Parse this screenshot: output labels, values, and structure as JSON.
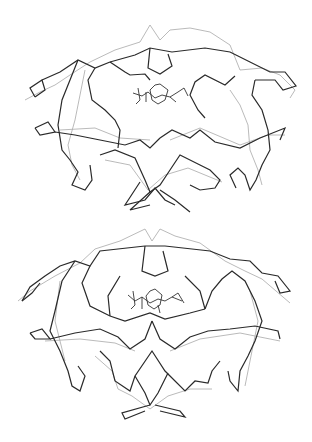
{
  "figure": {
    "panels": [
      {
        "id": "top",
        "description": "Superposition of two protein C-alpha backbone traces (dimer) with bound ligand in active site",
        "colors": {
          "dark": "#2a2a2a",
          "light": "#a8a8a8",
          "ligand": "#333333"
        },
        "dark_paths": [
          "35,97 30,88 42,80 45,90 35,97",
          "42,80 60,72 78,60 95,68 110,62",
          "110,62 135,55 150,48 172,52 205,48 230,52 250,62 270,72 285,72 296,86 283,90 275,80 255,80",
          "150,48 148,68 160,74 172,66 168,54",
          "110,62 125,72 130,75 145,74 150,80",
          "78,60 70,80 62,100 58,125 62,150 70,160 78,172 72,185 85,190 92,180 90,165",
          "95,68 88,80 92,100 105,110 115,120 120,130 118,148",
          "255,80 252,95 262,110 268,130 270,150 262,165 256,180 250,190 245,175 238,168 230,175 236,188",
          "235,76 225,85 205,75 195,82 190,95 198,110 205,118",
          "35,128 48,122 55,132 40,135 35,128",
          "55,132 75,135 100,140 125,145 140,140 150,148 160,138",
          "160,138 172,130 190,138 200,130 215,142 240,148 260,138 285,128 280,140",
          "100,155 115,150 135,158 145,180 150,192 160,185 170,170",
          "170,170 180,155 200,165 210,170 220,180 215,188 200,190 190,185",
          "140,182 125,205 145,200 155,188 165,200 175,205",
          "150,192 130,210 150,205",
          "160,190 175,200 190,212"
        ],
        "light_paths": [
          "25,100 40,92 55,85 70,75 90,62 115,50 140,42 150,25 160,40 170,30 190,28 210,32 230,45 240,70",
          "240,70 262,68 280,75 295,90 290,98",
          "85,70 80,95 75,120 68,145 72,165 80,180",
          "230,90 240,105 248,125 250,150 258,170 262,185",
          "60,130 95,128 120,138 150,140",
          "170,140 200,128 240,145 268,135 285,135",
          "105,160 130,165 148,190 165,175 188,168 222,182"
        ],
        "ligand_paths": [
          "133,93 142,96 148,92 155,98 162,95 170,97 178,92",
          "155,85 150,90 152,100 158,104 165,100 168,90 160,84 155,85",
          "138,88 140,100 136,104",
          "146,92 146,102",
          "170,97 176,102",
          "178,92 184,88 188,96"
        ]
      },
      {
        "id": "bottom",
        "description": "Superposition of two symmetric protein C-alpha backbone traces (dimer) with bound ligand",
        "colors": {
          "dark": "#2a2a2a",
          "light": "#a8a8a8",
          "ligand": "#333333"
        },
        "dark_paths": [
          "22,80 30,66 45,55 60,45 75,40 90,45 100,30 145,25 165,25 210,30 230,38 250,40 262,52 278,55 290,70 280,72 275,60",
          "145,25 142,50 155,55 168,50 163,30",
          "22,80 32,72 40,62",
          "75,40 62,60 55,90 50,110 60,130 68,150 72,165 80,170 85,155 78,145",
          "90,45 82,62 90,85 110,95 125,100 150,92 165,98 190,92 205,88",
          "205,88 212,70 222,58 232,50 245,60 255,80 262,100 255,120 248,135 240,150 238,170 230,160 228,150",
          "110,95 108,75 120,55",
          "205,88 200,70 185,55",
          "30,112 42,108 50,118 35,118 30,112",
          "50,118 75,112 100,108 118,116 130,128 145,118 152,100",
          "152,100 160,118 175,128 190,116 208,110 230,108 255,105 278,110 280,118",
          "100,130 110,140 115,160 130,170 135,155 152,130 165,150 185,170 195,160 208,162 212,150 220,140",
          "135,155 145,172 150,184 158,172 168,152",
          "150,184 122,192 125,198 145,190",
          "155,184 180,190 185,196 160,190"
        ],
        "light_paths": [
          "18,80 30,70 55,55 80,42 95,28 120,20 145,8 152,20 160,8 175,15 200,22 225,40 245,50 262,58 290,82",
          "60,60 55,100 65,140",
          "250,70 258,100 250,140 245,165",
          "45,120 80,118 115,122 135,130",
          "170,130 200,118 240,112 280,120",
          "95,135 112,150 118,168 132,175 150,188 168,175 190,168 212,168"
        ],
        "ligand_paths": [
          "128,74 135,80 142,76 150,82 158,78 165,80 172,76 182,80",
          "150,70 146,75 148,84 154,88 160,84 162,74 155,68 150,70",
          "133,70 135,84 131,88",
          "142,76 142,88",
          "158,84 160,92",
          "172,76 178,72 184,82"
        ]
      }
    ]
  }
}
